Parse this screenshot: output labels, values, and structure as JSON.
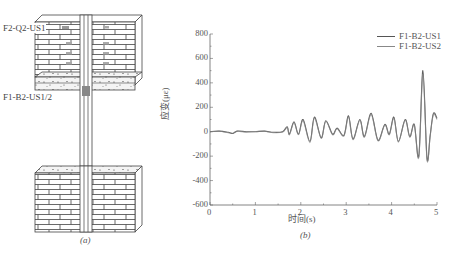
{
  "diagram": {
    "label_top": "F2-Q2-US1",
    "label_mid": "F1-B2-US1/2",
    "caption": "(a)"
  },
  "chart": {
    "caption": "(b)",
    "ylabel": "应变(με)",
    "xlabel": "时间(s)",
    "yticks": [
      "800",
      "600",
      "400",
      "200",
      "0",
      "-200",
      "-400",
      "-600"
    ],
    "xticks": [
      "0",
      "1",
      "2",
      "3",
      "4",
      "5"
    ],
    "legend": [
      "F1-B2-US1",
      "F1-B2-US2"
    ]
  },
  "colors": {
    "series1": "#555555",
    "series2": "#888888",
    "axis": "#666666"
  },
  "chart_data": {
    "type": "line",
    "title": "",
    "xlabel": "时间(s)",
    "ylabel": "应变(με)",
    "xlim": [
      0,
      5
    ],
    "ylim": [
      -600,
      800
    ],
    "grid": false,
    "legend_position": "upper right",
    "series": [
      {
        "name": "F1-B2-US1",
        "x": [
          0,
          0.2,
          0.4,
          0.5,
          0.6,
          0.8,
          1.0,
          1.2,
          1.4,
          1.6,
          1.7,
          1.75,
          1.85,
          1.95,
          2.05,
          2.2,
          2.3,
          2.45,
          2.55,
          2.7,
          2.8,
          2.95,
          3.05,
          3.15,
          3.3,
          3.4,
          3.55,
          3.7,
          3.85,
          3.95,
          4.05,
          4.15,
          4.3,
          4.4,
          4.5,
          4.6,
          4.69,
          4.78,
          4.85,
          4.92,
          5.0
        ],
        "y": [
          0,
          5,
          -5,
          -15,
          5,
          0,
          0,
          5,
          -5,
          0,
          40,
          -20,
          80,
          -20,
          100,
          -80,
          120,
          -50,
          90,
          -20,
          30,
          -30,
          130,
          -60,
          100,
          -40,
          150,
          -70,
          60,
          -20,
          120,
          -80,
          100,
          -40,
          60,
          -200,
          500,
          -220,
          -30,
          150,
          110
        ]
      },
      {
        "name": "F1-B2-US2",
        "x": [
          0,
          0.2,
          0.4,
          0.5,
          0.6,
          0.8,
          1.0,
          1.2,
          1.4,
          1.6,
          1.7,
          1.75,
          1.85,
          1.95,
          2.05,
          2.2,
          2.3,
          2.45,
          2.55,
          2.7,
          2.8,
          2.95,
          3.05,
          3.15,
          3.3,
          3.4,
          3.55,
          3.7,
          3.85,
          3.95,
          4.05,
          4.15,
          4.3,
          4.4,
          4.5,
          4.6,
          4.69,
          4.78,
          4.85,
          4.92,
          5.0
        ],
        "y": [
          0,
          3,
          -8,
          -12,
          3,
          -3,
          2,
          3,
          -8,
          -3,
          35,
          -25,
          75,
          -25,
          90,
          -90,
          110,
          -55,
          85,
          -25,
          25,
          -35,
          120,
          -65,
          95,
          -45,
          140,
          -75,
          55,
          -25,
          110,
          -85,
          95,
          -45,
          55,
          -210,
          470,
          -230,
          -35,
          140,
          100
        ]
      }
    ]
  }
}
